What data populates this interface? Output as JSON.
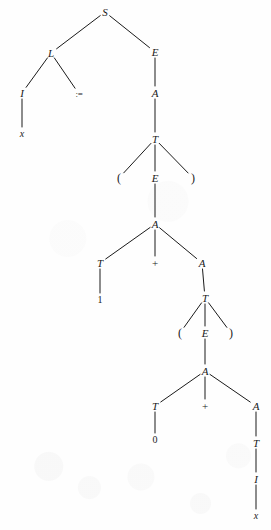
{
  "figure": {
    "type": "parse-tree",
    "background_color": "#fefefe",
    "ink_color": "#1a1a1a",
    "width": 271,
    "height": 530
  },
  "nodes": [
    {
      "id": "n0",
      "label": "S",
      "kind": "nonterminal",
      "x": 105,
      "y": 12
    },
    {
      "id": "n1",
      "label": "L",
      "kind": "nonterminal",
      "x": 51,
      "y": 53
    },
    {
      "id": "n2",
      "label": "E",
      "kind": "nonterminal",
      "x": 155,
      "y": 52
    },
    {
      "id": "n3",
      "label": "I",
      "kind": "nonterminal",
      "x": 22,
      "y": 93
    },
    {
      "id": "n4",
      "label": ":=",
      "kind": "op-assign",
      "x": 79,
      "y": 94
    },
    {
      "id": "n5",
      "label": "x",
      "kind": "terminal",
      "x": 22,
      "y": 134
    },
    {
      "id": "n6",
      "label": "A",
      "kind": "nonterminal",
      "x": 155,
      "y": 93
    },
    {
      "id": "n7",
      "label": "T",
      "kind": "nonterminal",
      "x": 155,
      "y": 139
    },
    {
      "id": "n8",
      "label": "(",
      "kind": "paren",
      "x": 119,
      "y": 178
    },
    {
      "id": "n9",
      "label": "E",
      "kind": "nonterminal",
      "x": 155,
      "y": 178
    },
    {
      "id": "n10",
      "label": ")",
      "kind": "paren",
      "x": 193,
      "y": 178
    },
    {
      "id": "n11",
      "label": "A",
      "kind": "nonterminal",
      "x": 155,
      "y": 224
    },
    {
      "id": "n12",
      "label": "T",
      "kind": "nonterminal",
      "x": 100,
      "y": 263
    },
    {
      "id": "n13",
      "label": "+",
      "kind": "op-plus",
      "x": 155,
      "y": 263
    },
    {
      "id": "n14",
      "label": "A",
      "kind": "nonterminal",
      "x": 202,
      "y": 263
    },
    {
      "id": "n15",
      "label": "1",
      "kind": "terminal-upright",
      "x": 100,
      "y": 300
    },
    {
      "id": "n16",
      "label": "T",
      "kind": "nonterminal",
      "x": 205,
      "y": 298
    },
    {
      "id": "n17",
      "label": "(",
      "kind": "paren",
      "x": 180,
      "y": 333
    },
    {
      "id": "n18",
      "label": "E",
      "kind": "nonterminal",
      "x": 205,
      "y": 333
    },
    {
      "id": "n19",
      "label": ")",
      "kind": "paren",
      "x": 231,
      "y": 333
    },
    {
      "id": "n20",
      "label": "A",
      "kind": "nonterminal",
      "x": 205,
      "y": 371
    },
    {
      "id": "n21",
      "label": "T",
      "kind": "nonterminal",
      "x": 155,
      "y": 406
    },
    {
      "id": "n22",
      "label": "+",
      "kind": "op-plus",
      "x": 205,
      "y": 406
    },
    {
      "id": "n23",
      "label": "A",
      "kind": "nonterminal",
      "x": 256,
      "y": 406
    },
    {
      "id": "n24",
      "label": "0",
      "kind": "terminal-upright",
      "x": 155,
      "y": 440
    },
    {
      "id": "n25",
      "label": "T",
      "kind": "nonterminal",
      "x": 256,
      "y": 443
    },
    {
      "id": "n26",
      "label": "I",
      "kind": "nonterminal",
      "x": 256,
      "y": 479
    },
    {
      "id": "n27",
      "label": "x",
      "kind": "terminal",
      "x": 256,
      "y": 516
    }
  ],
  "edges": [
    {
      "from": "n0",
      "to": "n1"
    },
    {
      "from": "n0",
      "to": "n2"
    },
    {
      "from": "n1",
      "to": "n3"
    },
    {
      "from": "n1",
      "to": "n4"
    },
    {
      "from": "n3",
      "to": "n5"
    },
    {
      "from": "n2",
      "to": "n6"
    },
    {
      "from": "n6",
      "to": "n7"
    },
    {
      "from": "n7",
      "to": "n8"
    },
    {
      "from": "n7",
      "to": "n9"
    },
    {
      "from": "n7",
      "to": "n10"
    },
    {
      "from": "n9",
      "to": "n11"
    },
    {
      "from": "n11",
      "to": "n12"
    },
    {
      "from": "n11",
      "to": "n13"
    },
    {
      "from": "n11",
      "to": "n14"
    },
    {
      "from": "n12",
      "to": "n15"
    },
    {
      "from": "n14",
      "to": "n16"
    },
    {
      "from": "n16",
      "to": "n17"
    },
    {
      "from": "n16",
      "to": "n18"
    },
    {
      "from": "n16",
      "to": "n19"
    },
    {
      "from": "n18",
      "to": "n20"
    },
    {
      "from": "n20",
      "to": "n21"
    },
    {
      "from": "n20",
      "to": "n22"
    },
    {
      "from": "n20",
      "to": "n23"
    },
    {
      "from": "n21",
      "to": "n24"
    },
    {
      "from": "n23",
      "to": "n25"
    },
    {
      "from": "n25",
      "to": "n26"
    },
    {
      "from": "n26",
      "to": "n27"
    }
  ]
}
